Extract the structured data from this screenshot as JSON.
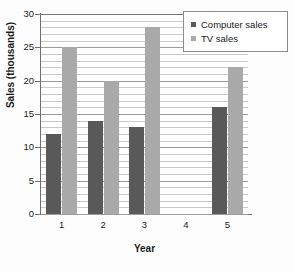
{
  "chart_data": {
    "type": "bar",
    "title": "",
    "xlabel": "Year",
    "ylabel": "Sales (thousands)",
    "categories": [
      "1",
      "2",
      "3",
      "4",
      "5"
    ],
    "series": [
      {
        "name": "Computer sales",
        "color": "#595959",
        "values": [
          12,
          14,
          13,
          0,
          16
        ]
      },
      {
        "name": "TV sales",
        "color": "#a9a9a9",
        "values": [
          25,
          20,
          28,
          0,
          22
        ]
      }
    ],
    "ylim": [
      0,
      30
    ],
    "y_major_ticks": [
      0,
      5,
      10,
      15,
      20,
      25,
      30
    ],
    "y_tick_labels": [
      "0",
      "5",
      "10",
      "15",
      "20",
      "25",
      "30"
    ],
    "y_minor_step": 1,
    "grid": true,
    "grid_axis": "y",
    "legend_position": "top-right"
  },
  "axes": {
    "y_title": "Sales (thousands)",
    "x_title": "Year"
  },
  "legend": {
    "items": [
      {
        "label": "Computer sales",
        "swatch": "#595959"
      },
      {
        "label": "TV sales",
        "swatch": "#a9a9a9"
      }
    ]
  }
}
